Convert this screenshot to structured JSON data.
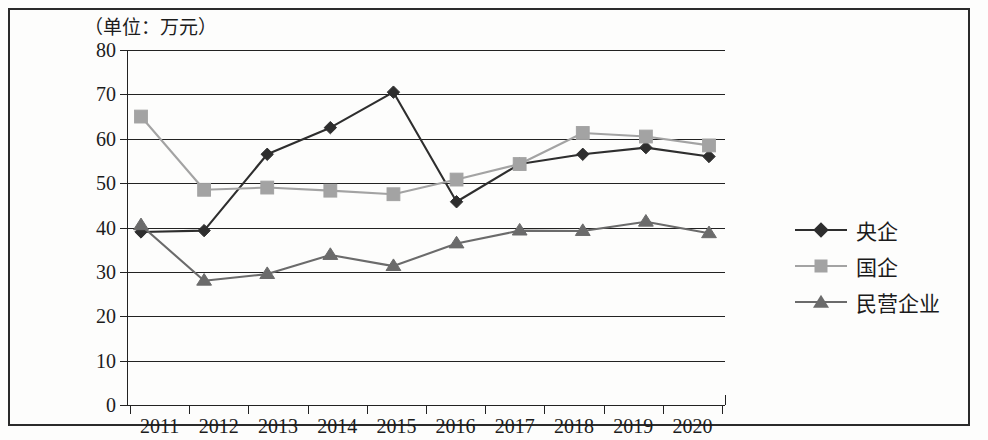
{
  "chart_data": {
    "type": "line",
    "title": "（单位：万元）",
    "xlabel": "",
    "ylabel": "",
    "unit_note": "（单位：万元）",
    "categories": [
      "2011",
      "2012",
      "2013",
      "2014",
      "2015",
      "2016",
      "2017",
      "2018",
      "2019",
      "2020"
    ],
    "y_ticks": [
      0,
      10,
      20,
      30,
      40,
      50,
      60,
      70,
      80
    ],
    "y_tick_labels": [
      "0",
      "10",
      "20",
      "30",
      "40",
      "50",
      "60",
      "70",
      "80"
    ],
    "ylim": [
      0,
      80
    ],
    "grid": true,
    "legend_position": "right",
    "series": [
      {
        "name": "央企",
        "marker": "diamond",
        "color": "#2e2e2e",
        "values": [
          39.0,
          39.3,
          56.5,
          62.5,
          70.5,
          45.8,
          54.3,
          56.5,
          58.0,
          56.0
        ]
      },
      {
        "name": "国企",
        "marker": "square",
        "color": "#a3a3a3",
        "values": [
          65.0,
          48.5,
          49.0,
          48.3,
          47.5,
          50.8,
          54.3,
          61.3,
          60.5,
          58.5
        ]
      },
      {
        "name": "民营企业",
        "marker": "triangle",
        "color": "#6b6b6b",
        "values": [
          40.5,
          28.0,
          29.5,
          33.8,
          31.3,
          36.4,
          39.3,
          39.2,
          41.3,
          38.7
        ]
      }
    ]
  },
  "legend": {
    "items": [
      {
        "label": "央企"
      },
      {
        "label": "国企"
      },
      {
        "label": "民营企业"
      }
    ]
  },
  "colors": {
    "axis": "#222222",
    "series_yangqi": "#2e2e2e",
    "series_guoqi": "#a3a3a3",
    "series_minying": "#6b6b6b",
    "background": "#ffffff"
  }
}
